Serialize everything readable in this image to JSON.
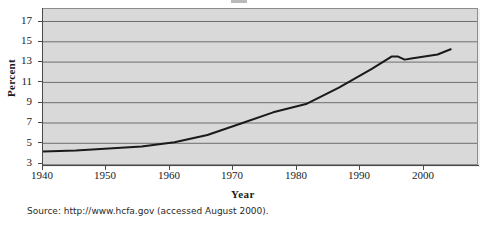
{
  "figure": {
    "axis_label_y": "Percent",
    "axis_label_x": "Year",
    "source_note": "Source: http://www.hcfa.gov (accessed August 2000)."
  },
  "chart_data": {
    "type": "line",
    "title": "",
    "xlabel": "Year",
    "ylabel": "Percent",
    "xlim": [
      1940,
      2006
    ],
    "ylim": [
      3,
      18
    ],
    "grid": true,
    "legend": "none",
    "xticks": [
      1940,
      1950,
      1960,
      1970,
      1980,
      1990,
      2000
    ],
    "xtick_labels": [
      "1940",
      "1950",
      "1960",
      "1970",
      "1980",
      "1990",
      "2000"
    ],
    "yticks": [
      3,
      5,
      7,
      9,
      11,
      13,
      15,
      17
    ],
    "ytick_labels": [
      "3",
      "5",
      "7",
      "9",
      "11",
      "13",
      "15",
      "17"
    ],
    "line_color": "#1a1a1a",
    "plot_background": "#d9d9d9",
    "series": [
      {
        "name": "Health care spending as percent of GDP",
        "x": [
          1940,
          1945,
          1950,
          1955,
          1960,
          1965,
          1970,
          1975,
          1980,
          1985,
          1990,
          1993,
          1994,
          1995,
          1996,
          1998,
          2000,
          2002
        ],
        "values": [
          4.2,
          4.3,
          4.5,
          4.7,
          5.1,
          5.8,
          6.9,
          8.0,
          8.8,
          10.4,
          12.2,
          13.4,
          13.4,
          13.1,
          13.2,
          13.4,
          13.6,
          14.1
        ]
      }
    ]
  }
}
